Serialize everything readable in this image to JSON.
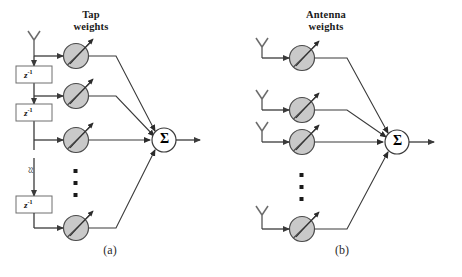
{
  "figure": {
    "width": 462,
    "height": 277,
    "background": "#ffffff",
    "line_color": "#3a3a3a",
    "weight_fill": "#c9c9c9",
    "weight_stroke": "#4a4a4a",
    "sigma_fill": "#ffffff",
    "box_fill": "#ffffff",
    "box_stroke": "#6e6e6e"
  },
  "panel_a": {
    "caption": "(a)",
    "heading": "Tap\nweights",
    "antenna_label": "antenna-icon",
    "delay_boxes": [
      {
        "label": "z",
        "exponent": "-1"
      },
      {
        "label": "z",
        "exponent": "-1"
      },
      {
        "label": "z",
        "exponent": "-1"
      }
    ],
    "break_symbol": "≈",
    "weights_count": 4,
    "weight_symbol": "variable-gain-circle",
    "vertical_dots": "⋮",
    "summation_symbol": "Σ",
    "output_arrow": "output-arrow"
  },
  "panel_b": {
    "caption": "(b)",
    "heading": "Antenna\nweights",
    "antennas_count": 4,
    "antenna_label": "antenna-icon",
    "weights_count": 4,
    "weight_symbol": "variable-gain-circle",
    "vertical_dots": "⋮",
    "summation_symbol": "Σ",
    "output_arrow": "output-arrow"
  }
}
